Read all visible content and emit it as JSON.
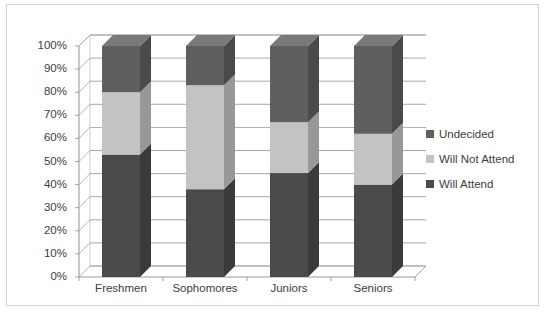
{
  "chart": {
    "type": "bar",
    "title": "",
    "xlabel": "",
    "ylabel": ""
  },
  "chart_data": {
    "type": "bar",
    "subtype": "100% stacked column (3-D)",
    "title": "",
    "xlabel": "",
    "ylabel": "",
    "ylim": [
      0,
      100
    ],
    "yunit": "%",
    "grid": true,
    "legend_position": "right",
    "categories": [
      "Freshmen",
      "Sophomores",
      "Juniors",
      "Seniors"
    ],
    "ytick_labels": [
      "0%",
      "10%",
      "20%",
      "30%",
      "40%",
      "50%",
      "60%",
      "70%",
      "80%",
      "90%",
      "100%"
    ],
    "ytick_values": [
      0,
      10,
      20,
      30,
      40,
      50,
      60,
      70,
      80,
      90,
      100
    ],
    "series": [
      {
        "name": "Will Attend",
        "color": "#4a4a4a",
        "values": [
          53,
          38,
          45,
          40
        ]
      },
      {
        "name": "Will Not Attend",
        "color": "#c3c3c3",
        "values": [
          27,
          45,
          22,
          22
        ]
      },
      {
        "name": "Undecided",
        "color": "#5f5f5f",
        "values": [
          20,
          17,
          33,
          38
        ]
      }
    ],
    "cumulative_tops": {
      "Will Attend": [
        53,
        38,
        45,
        40
      ],
      "Will Not Attend": [
        80,
        83,
        67,
        62
      ],
      "Undecided": [
        100,
        100,
        100,
        100
      ]
    },
    "legend_entries": [
      "Undecided",
      "Will Not Attend",
      "Will Attend"
    ]
  },
  "legend": {
    "items": [
      {
        "label": "Undecided",
        "color": "#5f5f5f"
      },
      {
        "label": "Will Not Attend",
        "color": "#c3c3c3"
      },
      {
        "label": "Will Attend",
        "color": "#4a4a4a"
      }
    ]
  },
  "axis": {
    "y": {
      "labels": [
        "100%",
        "90%",
        "80%",
        "70%",
        "60%",
        "50%",
        "40%",
        "30%",
        "20%",
        "10%",
        "0%"
      ]
    },
    "x": {
      "labels": [
        "Freshmen",
        "Sophomores",
        "Juniors",
        "Seniors"
      ]
    }
  },
  "style": {
    "border_color": "#d2d2d2",
    "gridline_color": "#7f7f7f",
    "axis_color": "#9a9a9a",
    "text_color": "#3d3d3d",
    "background": "#ffffff"
  }
}
